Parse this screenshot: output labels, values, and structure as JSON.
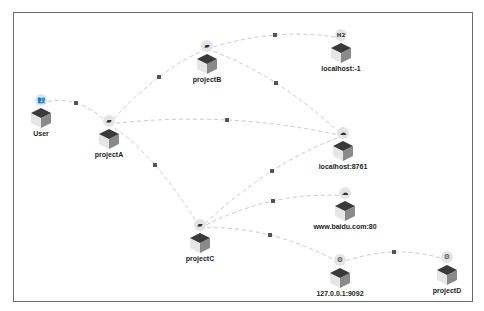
{
  "diagram": {
    "type": "service-topology",
    "colors": {
      "edge": "#c9c9c9",
      "edge_dot": "#555555",
      "cube_top": "#3a3a3a",
      "cube_left": "#e6e6e6",
      "cube_right": "#8a8a8a",
      "icon_bg": "#e4e4e4",
      "border": "#6b6b6b"
    },
    "nodes": [
      {
        "id": "user",
        "label": "User",
        "icon": "users-icon",
        "x": 41,
        "y": 117
      },
      {
        "id": "projectA",
        "label": "projectA",
        "icon": "server-icon",
        "x": 109,
        "y": 138
      },
      {
        "id": "projectB",
        "label": "projectB",
        "icon": "server-icon",
        "x": 207,
        "y": 63
      },
      {
        "id": "localhost-1",
        "label": "localhost:-1",
        "icon": "h2-database-icon",
        "x": 341,
        "y": 52
      },
      {
        "id": "localhost8761",
        "label": "localhost:8761",
        "icon": "cloud-icon",
        "x": 343,
        "y": 150
      },
      {
        "id": "baidu",
        "label": "www.baidu.com:80",
        "icon": "cloud-icon",
        "x": 345,
        "y": 210
      },
      {
        "id": "projectC",
        "label": "projectC",
        "icon": "server-icon",
        "x": 200,
        "y": 242
      },
      {
        "id": "kafka",
        "label": "127.0.0.1:9092",
        "icon": "kafka-icon",
        "x": 340,
        "y": 277
      },
      {
        "id": "projectD",
        "label": "projectD",
        "icon": "kafka-icon",
        "x": 447,
        "y": 274
      }
    ],
    "edges": [
      {
        "from": "user",
        "to": "projectA",
        "mid": [
          76,
          103
        ]
      },
      {
        "from": "projectA",
        "to": "projectB",
        "mid": [
          159,
          77
        ]
      },
      {
        "from": "projectB",
        "to": "localhost-1",
        "mid": [
          275,
          35
        ]
      },
      {
        "from": "projectB",
        "to": "localhost8761",
        "mid": [
          276,
          83
        ]
      },
      {
        "from": "projectA",
        "to": "localhost8761",
        "mid": [
          227,
          120
        ]
      },
      {
        "from": "projectA",
        "to": "projectC",
        "mid": [
          155,
          165
        ]
      },
      {
        "from": "projectC",
        "to": "localhost8761",
        "mid": [
          272,
          171
        ]
      },
      {
        "from": "projectC",
        "to": "baidu",
        "mid": [
          273,
          201
        ]
      },
      {
        "from": "projectC",
        "to": "kafka",
        "mid": [
          270,
          235
        ]
      },
      {
        "from": "kafka",
        "to": "projectD",
        "mid": [
          394,
          252
        ]
      }
    ]
  }
}
